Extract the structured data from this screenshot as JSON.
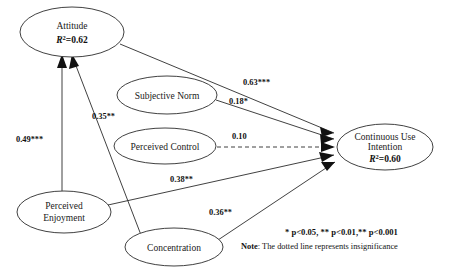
{
  "figure": {
    "type": "path-diagram"
  },
  "nodes": [
    {
      "id": "attitude",
      "label": "Attitude",
      "r2_prefix": "R",
      "r2_sup": "2",
      "r2_value": "=0.62",
      "r2_text": "R2=0.62",
      "cx": 72,
      "cy": 32,
      "rx": 52,
      "ry": 25
    },
    {
      "id": "subjective_norm",
      "label": "Subjective Norm",
      "r2_text": "",
      "cx": 167,
      "cy": 95,
      "rx": 50,
      "ry": 19
    },
    {
      "id": "perceived_control",
      "label": "Perceived Control",
      "r2_text": "",
      "cx": 165,
      "cy": 146,
      "rx": 51,
      "ry": 18
    },
    {
      "id": "perceived_enjoyment",
      "label_line1": "Perceived",
      "label_line2": "Enjoyment",
      "r2_text": "",
      "cx": 64,
      "cy": 212,
      "rx": 47,
      "ry": 21
    },
    {
      "id": "concentration",
      "label": "Concentration",
      "r2_text": "",
      "cx": 174,
      "cy": 247,
      "rx": 49,
      "ry": 19
    },
    {
      "id": "continuous_use_intention",
      "label_line1": "Continuous Use",
      "label_line2": "Intention",
      "r2_prefix": "R",
      "r2_sup": "2",
      "r2_value": "=0.60",
      "r2_text": "R2=0.60",
      "cx": 385,
      "cy": 147,
      "rx": 48,
      "ry": 23
    }
  ],
  "edges": [
    {
      "id": "attitude-to-cui",
      "from": "attitude",
      "to": "continuous_use_intention",
      "coefficient": "0.63***",
      "significance": "p<0.001",
      "style": "solid",
      "label_x": 243,
      "label_y": 85
    },
    {
      "id": "subjective-norm-to-cui",
      "from": "subjective_norm",
      "to": "continuous_use_intention",
      "coefficient": "0.18*",
      "significance": "p<0.05",
      "style": "solid",
      "label_x": 229,
      "label_y": 104
    },
    {
      "id": "perceived-control-to-cui",
      "from": "perceived_control",
      "to": "continuous_use_intention",
      "coefficient": "0.10",
      "significance": "insignificant",
      "style": "dashed",
      "label_x": 232,
      "label_y": 139
    },
    {
      "id": "perceived-enjoyment-to-cui",
      "from": "perceived_enjoyment",
      "to": "continuous_use_intention",
      "coefficient": "0.38**",
      "significance": "p<0.01",
      "style": "solid",
      "label_x": 170,
      "label_y": 182
    },
    {
      "id": "concentration-to-cui",
      "from": "concentration",
      "to": "continuous_use_intention",
      "coefficient": "0.36**",
      "significance": "p<0.01",
      "style": "solid",
      "label_x": 209,
      "label_y": 215
    },
    {
      "id": "perceived-enjoyment-to-attitude",
      "from": "perceived_enjoyment",
      "to": "attitude",
      "coefficient": "0.49***",
      "significance": "p<0.001",
      "style": "solid",
      "label_x": 16,
      "label_y": 142
    },
    {
      "id": "concentration-to-attitude",
      "from": "concentration",
      "to": "attitude",
      "coefficient": "0.35**",
      "significance": "p<0.01",
      "style": "solid",
      "label_x": 92,
      "label_y": 119
    }
  ],
  "legend": {
    "significance_line": "* p<0.05,  ** p<0.01,** p<0.001",
    "note_prefix": "Note",
    "note_text": ": The dotted line represents insignificance"
  }
}
